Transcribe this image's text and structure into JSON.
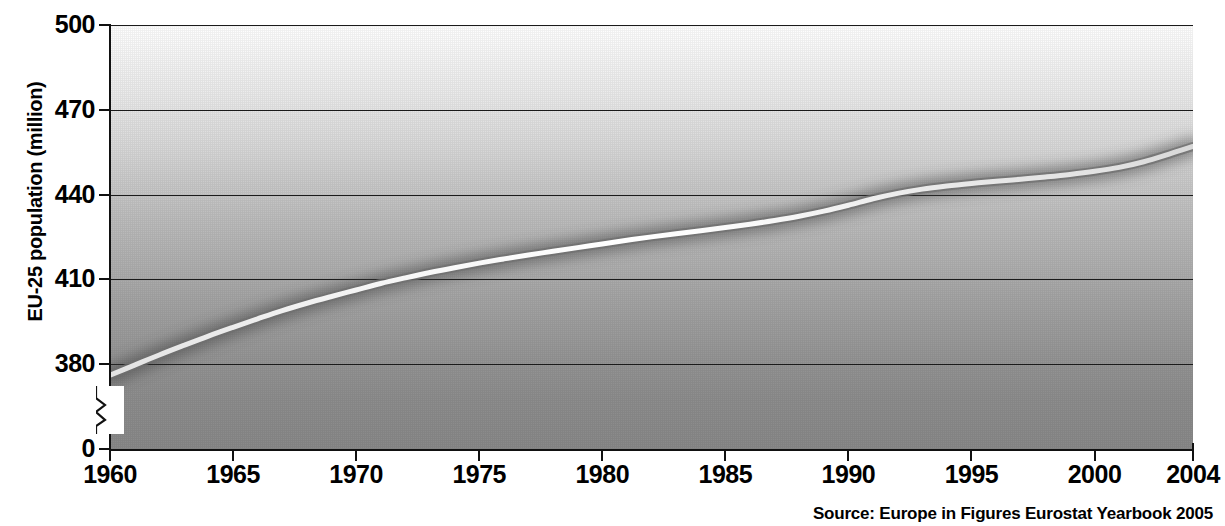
{
  "chart_data": {
    "type": "line",
    "title": "",
    "subtitle": "",
    "xlabel": "",
    "ylabel": "EU-25 population (million)",
    "xlim": [
      1960,
      2004
    ],
    "ylim": [
      380,
      500
    ],
    "y_axis_break": true,
    "y_axis_break_label": "0",
    "grid": true,
    "gridlines_y": [
      380,
      410,
      440,
      470,
      500
    ],
    "legend": "none",
    "x_ticks": [
      "1960",
      "1965",
      "1970",
      "1975",
      "1980",
      "1985",
      "1990",
      "1995",
      "2000",
      "2004"
    ],
    "y_ticks": [
      "0",
      "380",
      "410",
      "440",
      "470",
      "500"
    ],
    "series": [
      {
        "name": "EU-25 population",
        "x": [
          1960,
          1961,
          1962,
          1963,
          1964,
          1965,
          1966,
          1967,
          1968,
          1969,
          1970,
          1971,
          1972,
          1973,
          1974,
          1975,
          1976,
          1977,
          1978,
          1979,
          1980,
          1981,
          1982,
          1983,
          1984,
          1985,
          1986,
          1987,
          1988,
          1989,
          1990,
          1991,
          1992,
          1993,
          1994,
          1995,
          1996,
          1997,
          1998,
          1999,
          2000,
          2001,
          2002,
          2003,
          2004
        ],
        "values": [
          376.0,
          379.6,
          383.2,
          386.6,
          389.9,
          393.0,
          396.0,
          398.9,
          401.5,
          403.9,
          406.2,
          408.5,
          410.5,
          412.4,
          414.1,
          415.7,
          417.2,
          418.6,
          419.9,
          421.2,
          422.5,
          423.8,
          425.0,
          426.1,
          427.2,
          428.3,
          429.5,
          430.8,
          432.3,
          434.1,
          436.2,
          438.5,
          440.4,
          441.9,
          443.0,
          443.9,
          444.7,
          445.4,
          446.2,
          447.1,
          448.2,
          449.6,
          451.6,
          454.2,
          457.0
        ],
        "unit": "million",
        "start_value": 376.0,
        "end_value": 457.0
      }
    ],
    "source": "Source: Europe in Figures Eurostat Yearbook 2005",
    "colors": {
      "line": "#ffffff",
      "line_shadow": "#5a5a5a",
      "axis": "#111111",
      "grid": "#1a1a1a",
      "background_top": "#ffffff",
      "background_bottom": "#8a8a8a",
      "text": "#000000"
    }
  },
  "axis": {
    "y_title": "EU-25 population (million)",
    "y_ticks": [
      {
        "label": "500",
        "value": 500
      },
      {
        "label": "470",
        "value": 470
      },
      {
        "label": "440",
        "value": 440
      },
      {
        "label": "410",
        "value": 410
      },
      {
        "label": "380",
        "value": 380
      },
      {
        "label": "0",
        "value": 0
      }
    ],
    "x_ticks": [
      {
        "label": "1960",
        "value": 1960
      },
      {
        "label": "1965",
        "value": 1965
      },
      {
        "label": "1970",
        "value": 1970
      },
      {
        "label": "1975",
        "value": 1975
      },
      {
        "label": "1980",
        "value": 1980
      },
      {
        "label": "1985",
        "value": 1985
      },
      {
        "label": "1990",
        "value": 1990
      },
      {
        "label": "1995",
        "value": 1995
      },
      {
        "label": "2000",
        "value": 2000
      },
      {
        "label": "2004",
        "value": 2004
      }
    ]
  },
  "footer": {
    "source": "Source: Europe in Figures Eurostat Yearbook 2005"
  }
}
